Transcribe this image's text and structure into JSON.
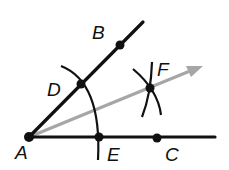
{
  "diagram": {
    "colors": {
      "line": "#111111",
      "bisector": "#a6a6a6",
      "background": "#ffffff"
    },
    "points": {
      "A": {
        "label": "A",
        "x": 29,
        "y": 137
      },
      "B": {
        "label": "B",
        "x": 120,
        "y": 45
      },
      "C": {
        "label": "C",
        "x": 157,
        "y": 138
      },
      "D": {
        "label": "D",
        "x": 81,
        "y": 84
      },
      "E": {
        "label": "E",
        "x": 99,
        "y": 137
      },
      "F": {
        "label": "F",
        "x": 150,
        "y": 88
      }
    },
    "labels": {
      "A": "A",
      "B": "B",
      "C": "C",
      "D": "D",
      "E": "E",
      "F": "F"
    },
    "rays": [
      {
        "name": "ray-AB",
        "from": "A",
        "through": "B"
      },
      {
        "name": "ray-AC",
        "from": "A",
        "through": "C"
      },
      {
        "name": "ray-AF",
        "from": "A",
        "through": "F",
        "style": "gray-arrow"
      }
    ]
  }
}
